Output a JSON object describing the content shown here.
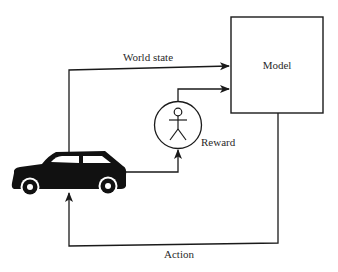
{
  "diagram": {
    "nodes": {
      "model": {
        "label": "Model"
      },
      "reward": {
        "label": "Reward",
        "icon": "stick-figure-icon"
      },
      "environment": {
        "icon": "car-icon"
      }
    },
    "edges": [
      {
        "from": "environment",
        "to": "model",
        "label": "World state"
      },
      {
        "from": "environment",
        "to": "reward",
        "label": ""
      },
      {
        "from": "reward",
        "to": "model",
        "label": ""
      },
      {
        "from": "model",
        "to": "environment",
        "label": "Action"
      }
    ],
    "colors": {
      "stroke": "#1a1a1a",
      "text": "#2a2a2a",
      "background": "#ffffff"
    }
  }
}
